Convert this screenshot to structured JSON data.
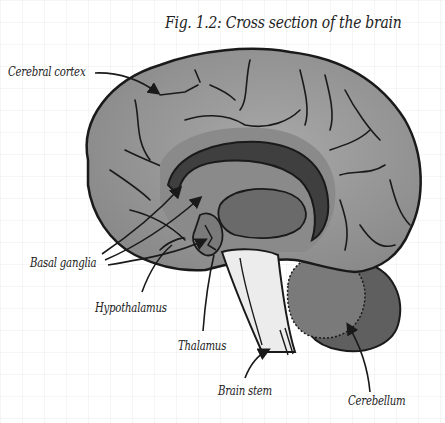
{
  "figure": {
    "title": "Fig. 1.2: Cross section of the brain",
    "labels": {
      "cerebral_cortex": "Cerebral cortex",
      "basal_ganglia": "Basal ganglia",
      "hypothalamus": "Hypothalamus",
      "thalamus": "Thalamus",
      "brain_stem": "Brain stem",
      "cerebellum": "Cerebellum"
    }
  },
  "colors": {
    "background": "#ffffff",
    "outline": "#1a1a1a",
    "cortex": "#9a9a9a",
    "inner_region": "#7e7e7e",
    "corpus_callosum": "#4a4a4a",
    "brain_stem": "#ececec",
    "cerebellum": "#6e6e6e"
  }
}
